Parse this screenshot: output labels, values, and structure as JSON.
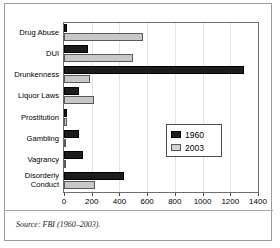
{
  "chart_data": {
    "type": "bar",
    "orientation": "horizontal",
    "title": "",
    "xlabel": "",
    "ylabel": "",
    "xlim": [
      0,
      1400
    ],
    "xticks": [
      0,
      200,
      400,
      600,
      800,
      1000,
      1200,
      1400
    ],
    "grid": true,
    "legend_position": "center-right",
    "categories": [
      "Drug Abuse",
      "DUI",
      "Drunkenness",
      "Liquor Laws",
      "Prostitution",
      "Gambling",
      "Vagrancy",
      "Disorderly\nConduct"
    ],
    "series": [
      {
        "name": "1960",
        "color": "#1c1c1c",
        "values": [
          25,
          170,
          1300,
          105,
          25,
          110,
          140,
          435
        ]
      },
      {
        "name": "2003",
        "color": "#c8c8c8",
        "values": [
          570,
          500,
          190,
          220,
          20,
          8,
          10,
          225
        ]
      }
    ]
  },
  "legend": {
    "entries": [
      {
        "label": "1960"
      },
      {
        "label": "2003"
      }
    ]
  },
  "source": {
    "note": "Source: FBI (1960–2003)."
  }
}
